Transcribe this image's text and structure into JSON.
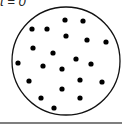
{
  "label": "t = 0",
  "circle": {
    "cx": 66,
    "cy": 61,
    "r": 54,
    "stroke": "#111111"
  },
  "particles": [
    [
      65,
      20
    ],
    [
      83,
      21
    ],
    [
      32,
      29
    ],
    [
      47,
      29
    ],
    [
      66,
      36
    ],
    [
      87,
      40
    ],
    [
      106,
      42
    ],
    [
      33,
      48
    ],
    [
      53,
      53
    ],
    [
      76,
      59
    ],
    [
      18,
      63
    ],
    [
      43,
      66
    ],
    [
      91,
      64
    ],
    [
      62,
      69
    ],
    [
      29,
      81
    ],
    [
      80,
      80
    ],
    [
      102,
      82
    ],
    [
      62,
      89
    ],
    [
      41,
      98
    ],
    [
      80,
      98
    ],
    [
      54,
      108
    ]
  ],
  "particle_color": "#000000",
  "baseline_color": "#555555"
}
